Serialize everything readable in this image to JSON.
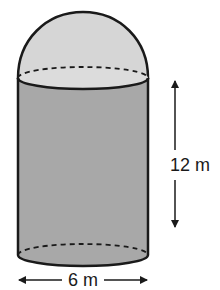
{
  "diagram": {
    "type": "composite-solid",
    "parts": [
      {
        "name": "hemisphere",
        "fill": "#d6d6d6"
      },
      {
        "name": "cylinder",
        "fill": "#a8a8a8"
      }
    ],
    "dimensions": {
      "height_label": "12 m",
      "diameter_label": "6 m"
    },
    "colors": {
      "outline": "#1a1a1a",
      "dome_fill": "#d6d6d6",
      "top_face_fill": "#dcdcdc",
      "cylinder_fill": "#a8a8a8",
      "background": "#ffffff"
    }
  }
}
